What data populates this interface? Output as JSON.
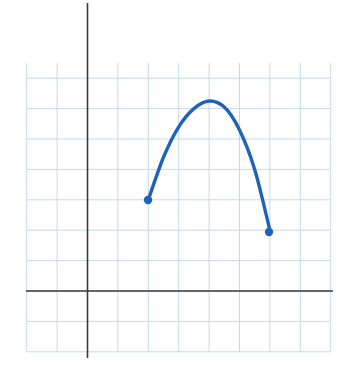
{
  "chart_data": {
    "type": "line",
    "title": "",
    "subtitle": "",
    "xlabel": "",
    "ylabel": "",
    "grid": true,
    "legend": null,
    "grid_spacing_px": 30.4,
    "axes": {
      "x_axis_label": "x",
      "y_axis_label": "y",
      "x_axis_color": "#3a3a3a",
      "y_axis_color": "#3a3a3a",
      "origin_px": [
        87.5,
        291
      ],
      "x_axis_span_px": [
        26,
        333
      ],
      "y_axis_span_px": [
        3,
        358
      ],
      "xlim": [
        -2,
        8
      ],
      "ylim": [
        -2,
        7.5
      ],
      "xticks": [
        -2,
        -1,
        0,
        1,
        2,
        3,
        4,
        5,
        6,
        7,
        8
      ],
      "yticks": [
        -2,
        -1,
        0,
        1,
        2,
        3,
        4,
        5,
        6,
        7
      ]
    },
    "curve": {
      "name": "parabola-arc",
      "color": "#1f63b8",
      "line_width": 3.4,
      "vertex": {
        "x": 4,
        "y": 6.25,
        "px": [
          209,
          101
        ]
      },
      "endpoints": [
        {
          "x": 2,
          "y": 3,
          "px": [
            148,
            200
          ],
          "marker": "filled-circle"
        },
        {
          "x": 6,
          "y": 2,
          "px": [
            269,
            232
          ],
          "marker": "filled-circle"
        }
      ],
      "points": [
        {
          "x": 2.0,
          "y": 3.0
        },
        {
          "x": 2.5,
          "y": 4.4
        },
        {
          "x": 3.0,
          "y": 5.4
        },
        {
          "x": 3.5,
          "y": 6.0
        },
        {
          "x": 4.0,
          "y": 6.25
        },
        {
          "x": 4.5,
          "y": 6.05
        },
        {
          "x": 5.0,
          "y": 5.3
        },
        {
          "x": 5.5,
          "y": 4.0
        },
        {
          "x": 6.0,
          "y": 2.0
        }
      ],
      "marker_radius_px": 4.2,
      "marker_color": "#1f63b8"
    },
    "grid_color_major": "#c5d9ec",
    "grid_color_minor": "#e2edf6",
    "background_color": "#ffffff"
  },
  "figure": {
    "width_px": 347,
    "height_px": 366
  }
}
